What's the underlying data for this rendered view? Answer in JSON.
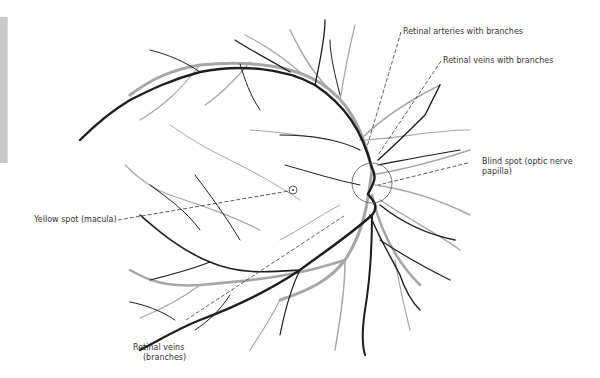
{
  "diagram": {
    "colors": {
      "veins": "#1e1e1e",
      "arteries": "#a6a6a6",
      "leader": "#333333",
      "text": "#333333",
      "side_bar": "#c8c8c8"
    },
    "labels": {
      "arteries": "Retinal arteries with branches",
      "veins": "Retinal veins with branches",
      "blind_spot_line1": "Blind spot (optic nerve",
      "blind_spot_line2": "papilla)",
      "macula": "Yellow spot (macula)",
      "vein_branches_line1": "Retinal veins",
      "vein_branches_line2": "(branches)"
    }
  }
}
